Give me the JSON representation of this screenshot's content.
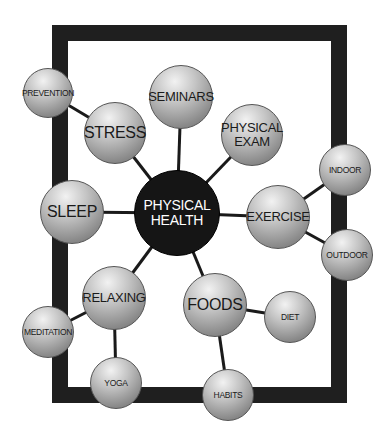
{
  "diagram": {
    "center": {
      "id": "physical-health",
      "label": "PHYSICAL HEALTH",
      "line1": "PHYSICAL",
      "line2": "HEALTH",
      "x": 177,
      "y": 213,
      "r": 43,
      "color": "#151515"
    },
    "nodes": [
      {
        "id": "prevention",
        "label": "PREVENTION",
        "x": 48,
        "y": 93,
        "r": 25,
        "size": "sm"
      },
      {
        "id": "stress",
        "label": "STRESS",
        "x": 115,
        "y": 133,
        "r": 31,
        "size": "lg"
      },
      {
        "id": "seminars",
        "label": "SEMINARS",
        "x": 181,
        "y": 97,
        "r": 32,
        "size": "md"
      },
      {
        "id": "physical-exam",
        "label": "PHYSICAL EXAM",
        "line1": "PHYSICAL",
        "line2": "EXAM",
        "x": 252,
        "y": 135,
        "r": 31,
        "size": "md"
      },
      {
        "id": "indoor",
        "label": "INDOOR",
        "x": 345,
        "y": 170,
        "r": 26,
        "size": "sm"
      },
      {
        "id": "sleep",
        "label": "SLEEP",
        "x": 72,
        "y": 212,
        "r": 32,
        "size": "lg"
      },
      {
        "id": "exercise",
        "label": "EXERCISE",
        "x": 278,
        "y": 217,
        "r": 32,
        "size": "md"
      },
      {
        "id": "outdoor",
        "label": "OUTDOOR",
        "x": 347,
        "y": 255,
        "r": 26,
        "size": "sm"
      },
      {
        "id": "relaxing",
        "label": "RELAXING",
        "x": 114,
        "y": 298,
        "r": 32,
        "size": "md"
      },
      {
        "id": "foods",
        "label": "FOODS",
        "x": 215,
        "y": 305,
        "r": 32,
        "size": "lg"
      },
      {
        "id": "diet",
        "label": "DIET",
        "x": 290,
        "y": 317,
        "r": 26,
        "size": "sm"
      },
      {
        "id": "meditation",
        "label": "MEDITATION",
        "x": 48,
        "y": 332,
        "r": 26,
        "size": "sm"
      },
      {
        "id": "yoga",
        "label": "YOGA",
        "x": 116,
        "y": 383,
        "r": 26,
        "size": "sm"
      },
      {
        "id": "habits",
        "label": "HABITS",
        "x": 228,
        "y": 395,
        "r": 26,
        "size": "sm"
      }
    ],
    "edges": [
      [
        "physical-health",
        "stress"
      ],
      [
        "physical-health",
        "seminars"
      ],
      [
        "physical-health",
        "physical-exam"
      ],
      [
        "physical-health",
        "sleep"
      ],
      [
        "physical-health",
        "exercise"
      ],
      [
        "physical-health",
        "relaxing"
      ],
      [
        "physical-health",
        "foods"
      ],
      [
        "stress",
        "prevention"
      ],
      [
        "exercise",
        "indoor"
      ],
      [
        "exercise",
        "outdoor"
      ],
      [
        "relaxing",
        "meditation"
      ],
      [
        "relaxing",
        "yoga"
      ],
      [
        "foods",
        "diet"
      ],
      [
        "foods",
        "habits"
      ]
    ],
    "frame_color": "#1f1f1f",
    "edge_color": "#1a1a1a"
  }
}
